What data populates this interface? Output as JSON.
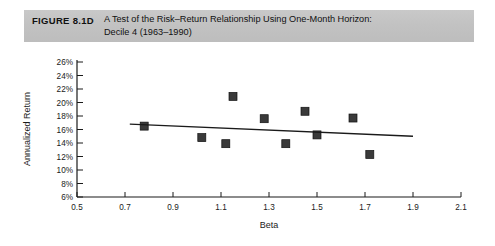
{
  "caption": {
    "figure_number": "FIGURE 8.1D",
    "line1": "A Test of the Risk–Return Relationship Using One-Month Horizon:",
    "line2": "Decile 4 (1963–1990)"
  },
  "chart_data": {
    "type": "scatter",
    "title": "A Test of the Risk–Return Relationship Using One-Month Horizon: Decile 4 (1963–1990)",
    "xlabel": "Beta",
    "ylabel": "Annualized Return",
    "xlim": [
      0.5,
      2.1
    ],
    "ylim": [
      6,
      26
    ],
    "xticks": [
      0.5,
      0.7,
      0.9,
      1.1,
      1.3,
      1.5,
      1.7,
      1.9,
      2.1
    ],
    "xtick_labels": [
      "0.5",
      "0.7",
      "0.9",
      "1.1",
      "1.3",
      "1.5",
      "1.7",
      "1.9",
      "2.1"
    ],
    "yticks": [
      6,
      8,
      10,
      12,
      14,
      16,
      18,
      20,
      22,
      24,
      26
    ],
    "ytick_labels": [
      "6%",
      "8%",
      "10%",
      "12%",
      "14%",
      "16%",
      "18%",
      "20%",
      "22%",
      "24%",
      "26%"
    ],
    "grid": false,
    "legend": null,
    "marker_style": "filled-square",
    "points": [
      {
        "x": 0.78,
        "y": 16.5
      },
      {
        "x": 1.02,
        "y": 14.8
      },
      {
        "x": 1.12,
        "y": 13.9
      },
      {
        "x": 1.15,
        "y": 20.9
      },
      {
        "x": 1.28,
        "y": 17.6
      },
      {
        "x": 1.37,
        "y": 13.9
      },
      {
        "x": 1.45,
        "y": 18.7
      },
      {
        "x": 1.5,
        "y": 15.2
      },
      {
        "x": 1.65,
        "y": 17.7
      },
      {
        "x": 1.72,
        "y": 12.3
      }
    ],
    "trendline": {
      "x_start": 0.72,
      "y_start": 16.8,
      "x_end": 1.9,
      "y_end": 15.0,
      "description": "downward-sloping fitted regression line"
    },
    "colors": {
      "marker": "#3a3a3a",
      "axis": "#1a1a1a",
      "trendline": "#1a1a1a",
      "caption_bar": "#c2c2c2",
      "background": "#ffffff"
    }
  }
}
